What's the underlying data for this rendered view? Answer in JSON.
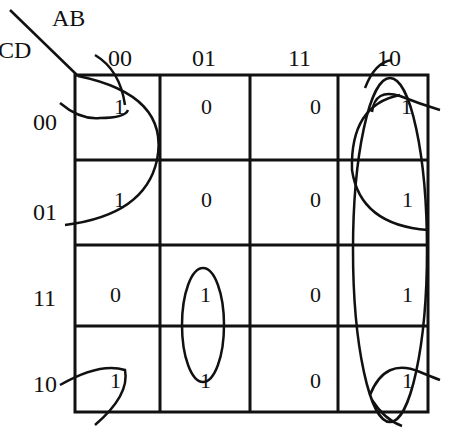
{
  "axes": {
    "column_variable": "AB",
    "row_variable": "CD"
  },
  "columns": [
    "00",
    "01",
    "11",
    "10"
  ],
  "rows": [
    "00",
    "01",
    "11",
    "10"
  ],
  "cells": [
    [
      "1",
      "0",
      "0",
      "1"
    ],
    [
      "1",
      "0",
      "0",
      "1"
    ],
    [
      "0",
      "1",
      "0",
      "1"
    ],
    [
      "1",
      "1",
      "0",
      "1"
    ]
  ],
  "groupings": [
    {
      "name": "corner-group",
      "cells": [
        "00-00",
        "00-10",
        "10-00",
        "10-10"
      ],
      "shape": "wrap-around arcs at four corners"
    },
    {
      "name": "column-10-and-rows-00-01-left",
      "cells": [
        "00-00",
        "01-00"
      ],
      "shape": "left arc spanning rows 00-01 of column 00"
    },
    {
      "name": "column-10-rows-00-01",
      "cells": [
        "00-10",
        "01-10"
      ],
      "shape": "arc spanning rows 00-01 of column 10"
    },
    {
      "name": "column-10-all",
      "cells": [
        "00-10",
        "01-10",
        "11-10",
        "10-10"
      ],
      "shape": "tall ellipse over column 10"
    },
    {
      "name": "column-01-rows-11-10",
      "cells": [
        "11-01",
        "10-01"
      ],
      "shape": "vertical ellipse"
    }
  ]
}
